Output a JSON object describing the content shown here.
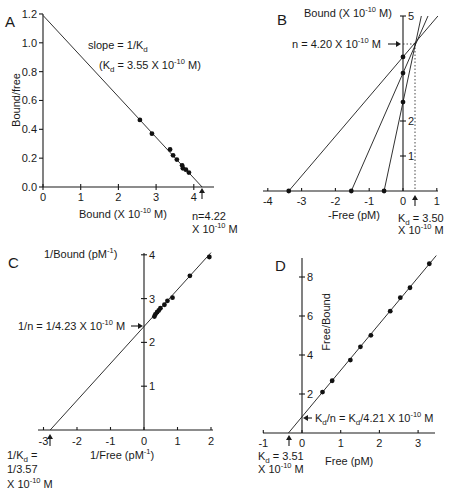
{
  "chart_data": [
    {
      "panel": "A",
      "type": "scatter",
      "title": "Scatchard plot",
      "xlabel": "Bound (X 10^-10 M)",
      "ylabel": "Bound/free",
      "xlim": [
        0,
        4.5
      ],
      "ylim": [
        0,
        1.2
      ],
      "xticks": [
        0,
        1,
        2,
        3,
        4
      ],
      "yticks": [
        0.0,
        0.2,
        0.4,
        0.6,
        0.8,
        1.0,
        1.2
      ],
      "points": [
        [
          2.57,
          0.465
        ],
        [
          2.89,
          0.37
        ],
        [
          3.37,
          0.26
        ],
        [
          3.45,
          0.22
        ],
        [
          3.55,
          0.19
        ],
        [
          3.69,
          0.15
        ],
        [
          3.71,
          0.13
        ],
        [
          3.79,
          0.12
        ],
        [
          3.87,
          0.1
        ]
      ],
      "fit_line": {
        "x": [
          0,
          4.22
        ],
        "y": [
          1.19,
          0
        ]
      },
      "annotations": [
        "slope = 1/Kd",
        "(Kd = 3.55 X 10^-10 M)",
        "n=4.22 X 10^-10 M"
      ]
    },
    {
      "panel": "B",
      "type": "line",
      "title": "Direct linear plot",
      "xlabel": "-Free (pM)",
      "ylabel": "Bound (X 10^-10 M)",
      "xlim": [
        -4,
        1
      ],
      "ylim": [
        0,
        5
      ],
      "xticks": [
        -4,
        -3,
        -2,
        -1,
        0,
        1
      ],
      "yticks": [
        1,
        2,
        5
      ],
      "lines": [
        {
          "x_intercept": -3.38,
          "y_intercept": 3.83
        },
        {
          "x_intercept": -1.53,
          "y_intercept": 3.37
        },
        {
          "x_intercept": -0.56,
          "y_intercept": 2.54
        }
      ],
      "intersection": {
        "x": 0.35,
        "y": 4.2
      },
      "annotations": [
        "n = 4.20 X 10^-10 M",
        "Kd = 3.50 X 10^-10 M"
      ]
    },
    {
      "panel": "C",
      "type": "scatter",
      "title": "Double-reciprocal plot",
      "xlabel": "1/Free (pM^-1)",
      "ylabel": "1/Bound (pM^-1)",
      "xlim": [
        -3,
        2
      ],
      "ylim": [
        0,
        4
      ],
      "xticks": [
        -3,
        -2,
        -1,
        0,
        1,
        2
      ],
      "yticks": [
        1,
        2,
        3,
        4
      ],
      "points": [
        [
          1.95,
          3.95
        ],
        [
          1.37,
          3.52
        ],
        [
          0.85,
          3.02
        ],
        [
          0.7,
          2.95
        ],
        [
          0.61,
          2.86
        ],
        [
          0.49,
          2.78
        ],
        [
          0.44,
          2.73
        ],
        [
          0.39,
          2.69
        ],
        [
          0.34,
          2.64
        ],
        [
          0.31,
          2.59
        ]
      ],
      "fit_line": {
        "x": [
          -2.8,
          2.0
        ],
        "y": [
          0.0,
          4.05
        ]
      },
      "annotations": [
        "1/n = 1/4.23 X 10^-10 M",
        "1/Kd = 1/3.57 X 10^-10 M"
      ]
    },
    {
      "panel": "D",
      "type": "scatter",
      "title": "Hanes-Woolf plot",
      "xlabel": "Free (pM)",
      "ylabel": "Free/Bound",
      "xlim": [
        -1,
        3.5
      ],
      "ylim": [
        0,
        9
      ],
      "xticks": [
        -1,
        0,
        1,
        2,
        3
      ],
      "yticks": [
        2,
        4,
        6,
        8
      ],
      "points": [
        [
          0.53,
          2.1
        ],
        [
          0.78,
          2.68
        ],
        [
          1.25,
          3.74
        ],
        [
          1.51,
          4.42
        ],
        [
          1.78,
          5.01
        ],
        [
          2.28,
          6.25
        ],
        [
          2.54,
          6.94
        ],
        [
          2.79,
          7.45
        ],
        [
          3.29,
          8.68
        ]
      ],
      "fit_line": {
        "x": [
          -0.35,
          3.47
        ],
        "y": [
          0,
          9.1
        ]
      },
      "annotations": [
        "Kd/n = Kd/4.21 X 10^-10 M",
        "Kd = 3.51 X 10^-10 M"
      ]
    }
  ],
  "labels": {
    "A": {
      "panel": "A",
      "ylabel": "Bound/free",
      "xlabel_main": "Bound (X 10",
      "xlabel_exp": "-10",
      "xlabel_end": " M)",
      "xticks": [
        "0",
        "1",
        "2",
        "3",
        "4"
      ],
      "yticks": [
        "0.0",
        "0.2",
        "0.4",
        "0.6",
        "0.8",
        "1.0",
        "1.2"
      ],
      "slope_text": "slope = 1/K",
      "slope_sub": "d",
      "kd_open": "(K",
      "kd_sub": "d",
      "kd_main": " = 3.55 X 10",
      "kd_exp": "-10",
      "kd_end": " M)",
      "n_line1": "n=4.22",
      "n_line2": "X 10",
      "n_exp": "-10",
      "n_end": " M"
    },
    "B": {
      "panel": "B",
      "ylabel_main": "Bound (X 10",
      "ylabel_exp": "-10",
      "ylabel_end": " M)",
      "xlabel": "-Free (pM)",
      "xticks": [
        "-4",
        "-3",
        "-2",
        "-1",
        "0",
        "1"
      ],
      "yticks": [
        "1",
        "2",
        "5"
      ],
      "n_text": "n = 4.20 X 10",
      "n_exp": "-10",
      "n_end": " M",
      "kd_k": "K",
      "kd_sub": "d",
      "kd_main": " = 3.50",
      "kd_line2": "X 10",
      "kd_exp": "-10",
      "kd_end": " M"
    },
    "C": {
      "panel": "C",
      "ylabel_main": "1/Bound (pM",
      "ylabel_exp": "-1",
      "ylabel_end": ")",
      "xlabel_main": "1/Free (pM",
      "xlabel_exp": "-1",
      "xlabel_end": ")",
      "xticks": [
        "-3",
        "-2",
        "-1",
        "0",
        "1",
        "2"
      ],
      "yticks": [
        "1",
        "2",
        "3",
        "4"
      ],
      "n_text": "1/n = 1/4.23 X 10",
      "n_exp": "-10",
      "n_end": " M",
      "kd_line1": "1/K",
      "kd_sub": "d",
      "kd_eq": " =",
      "kd_line2": "1/3.57",
      "kd_line3": "X 10",
      "kd_exp": "-10",
      "kd_end": " M"
    },
    "D": {
      "panel": "D",
      "ylabel": "Free/Bound",
      "xlabel": "Free (pM)",
      "xticks": [
        "-1",
        "0",
        "1",
        "2",
        "3"
      ],
      "yticks": [
        "2",
        "4",
        "6",
        "8"
      ],
      "ratio_k": "K",
      "ratio_sub": "d",
      "ratio_mid": "/n = K",
      "ratio_sub2": "d",
      "ratio_main": "/4.21 X 10",
      "ratio_exp": "-10",
      "ratio_end": " M",
      "kd_k": "K",
      "kd_sub": "d",
      "kd_main": " = 3.51",
      "kd_line2": "X 10",
      "kd_exp": "-10",
      "kd_end": " M"
    }
  }
}
